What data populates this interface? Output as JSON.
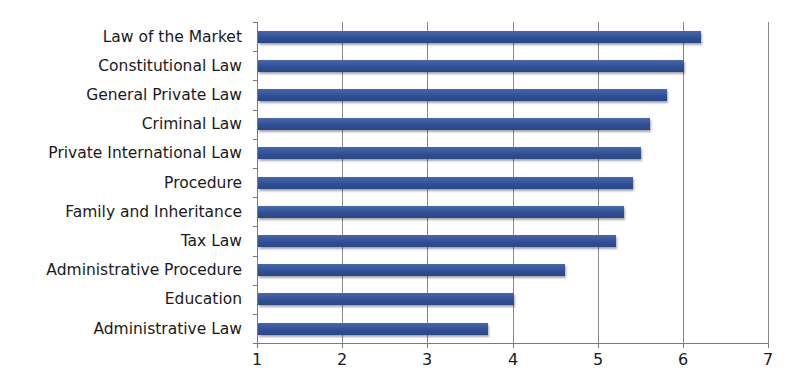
{
  "chart_data": {
    "type": "bar",
    "orientation": "horizontal",
    "title": "",
    "xlabel": "",
    "ylabel": "",
    "categories": [
      "Law of the Market",
      "Constitutional Law",
      "General Private Law",
      "Criminal Law",
      "Private International Law",
      "Procedure",
      "Family and Inheritance",
      "Tax Law",
      "Administrative Procedure",
      "Education",
      "Administrative Law"
    ],
    "values": [
      6.2,
      6.0,
      5.8,
      5.6,
      5.5,
      5.4,
      5.3,
      5.2,
      4.6,
      4.0,
      3.7
    ],
    "xlim": [
      1,
      7
    ],
    "xticks": [
      "1",
      "2",
      "3",
      "4",
      "5",
      "6",
      "7"
    ],
    "grid": "vertical",
    "legend": "none",
    "bar_color": "#3a59a0"
  }
}
